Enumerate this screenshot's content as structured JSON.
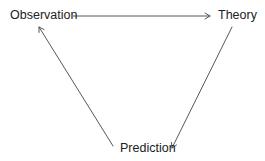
{
  "diagram": {
    "type": "cycle",
    "nodes": [
      {
        "id": "observation",
        "label": "Observation"
      },
      {
        "id": "theory",
        "label": "Theory"
      },
      {
        "id": "prediction",
        "label": "Prediction"
      }
    ],
    "edges": [
      {
        "from": "observation",
        "to": "theory"
      },
      {
        "from": "theory",
        "to": "prediction"
      },
      {
        "from": "prediction",
        "to": "observation"
      }
    ],
    "colors": {
      "line": "#333333",
      "text": "#222222",
      "background": "#ffffff"
    }
  }
}
